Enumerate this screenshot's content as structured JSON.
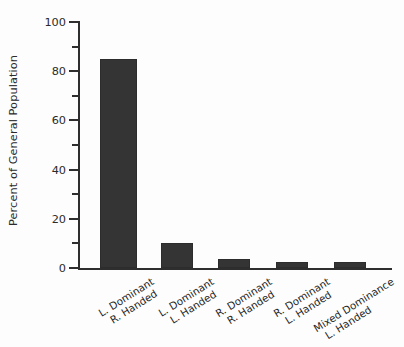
{
  "chart_data": {
    "type": "bar",
    "title": "",
    "subtitle": "",
    "xlabel": "",
    "ylabel": "Percent of General Population",
    "ylim": [
      0,
      100
    ],
    "xlim_note": "5 categorical bars",
    "grid": false,
    "legend": null,
    "legend_position": "none",
    "bar_color": "#343434",
    "axis_color": "#2e2e2e",
    "background_color": "#fdfdfd",
    "y_major_ticks": [
      0,
      20,
      40,
      60,
      80,
      100
    ],
    "y_minor_ticks": [
      10,
      30,
      50,
      70,
      90
    ],
    "y_tick_labels": [
      "0",
      "20",
      "40",
      "60",
      "80",
      "100"
    ],
    "categories": [
      "L. Dominant R. Handed",
      "L. Dominant L. Handed",
      "R. Dominant R. Handed",
      "R. Dominant L. Handed",
      "Mixed Dominance L. Handed"
    ],
    "category_lines": [
      [
        "L. Dominant",
        "R. Handed"
      ],
      [
        "L. Dominant",
        "L. Handed"
      ],
      [
        "R. Dominant",
        "R. Handed"
      ],
      [
        "R. Dominant",
        "L. Handed"
      ],
      [
        "Mixed Dominance",
        "L. Handed"
      ]
    ],
    "values": [
      85,
      10,
      3.5,
      2.5,
      2.5
    ]
  },
  "axis": {
    "y_title": "Percent of General Population",
    "ticks": [
      {
        "value": "100",
        "label": "100",
        "major": true
      },
      {
        "value": "90",
        "label": "",
        "major": false
      },
      {
        "value": "80",
        "label": "80",
        "major": true
      },
      {
        "value": "70",
        "label": "",
        "major": false
      },
      {
        "value": "60",
        "label": "60",
        "major": true
      },
      {
        "value": "50",
        "label": "",
        "major": false
      },
      {
        "value": "40",
        "label": "40",
        "major": true
      },
      {
        "value": "30",
        "label": "",
        "major": false
      },
      {
        "value": "20",
        "label": "20",
        "major": true
      },
      {
        "value": "10",
        "label": "",
        "major": false
      },
      {
        "value": "0",
        "label": "0",
        "major": true
      }
    ]
  }
}
